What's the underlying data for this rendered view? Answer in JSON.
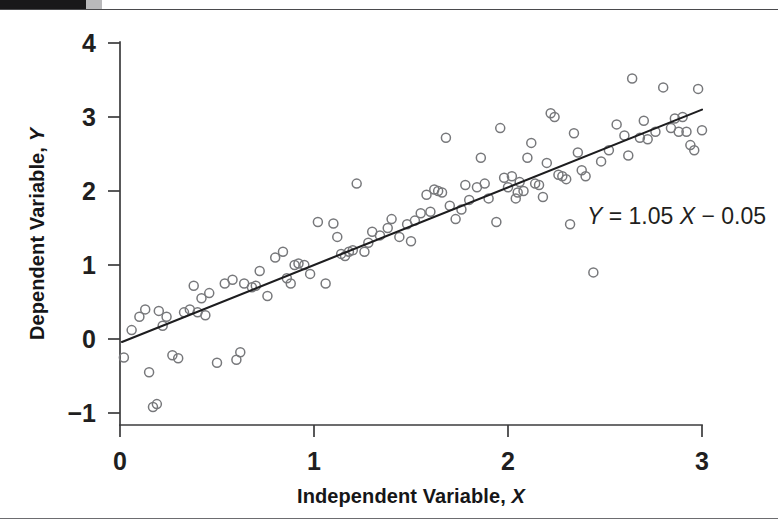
{
  "figure": {
    "background_color": "#ffffff",
    "top_bar_color": "#19181a",
    "top_bar_accent_color": "#b9b9bb",
    "rule_color": "#4a4a4d"
  },
  "chart_data": {
    "type": "scatter",
    "title": "",
    "xlabel": "Independent Variable, X",
    "ylabel": "Dependent Variable, Y",
    "xlabel_text": "Independent Variable, ",
    "xlabel_symbol": "X",
    "ylabel_text": "Dependent Variable, ",
    "ylabel_symbol": "Y",
    "xlim": [
      -0.08,
      3.12
    ],
    "ylim": [
      -1.25,
      4.15
    ],
    "xticks": [
      0,
      1,
      2,
      3
    ],
    "xtick_labels": [
      "0",
      "1",
      "2",
      "3"
    ],
    "yticks": [
      -1,
      0,
      1,
      2,
      3,
      4
    ],
    "ytick_labels": [
      "−1",
      "0",
      "1",
      "2",
      "3",
      "4"
    ],
    "grid": false,
    "legend": null,
    "marker_style": "open-circle",
    "marker_color": "#77787b",
    "marker_size": 9,
    "annotations": [
      {
        "name": "regression-equation",
        "text": "Y = 1.05 X − 0.05",
        "parts": [
          "Y",
          " = 1.05 ",
          "X",
          " − 0.05"
        ],
        "x": 2.42,
        "y": 1.72
      }
    ],
    "fit_line": {
      "name": "least-squares-line",
      "slope": 1.05,
      "intercept": -0.05,
      "color": "#1d1d1f",
      "x_start": 0.01,
      "x_end": 3.0,
      "y_start": -0.04,
      "y_end": 3.1
    },
    "x": [
      0.02,
      0.06,
      0.1,
      0.13,
      0.15,
      0.17,
      0.19,
      0.2,
      0.22,
      0.24,
      0.3,
      0.33,
      0.36,
      0.38,
      0.4,
      0.42,
      0.46,
      0.5,
      0.54,
      0.58,
      0.62,
      0.64,
      0.68,
      0.7,
      0.72,
      0.76,
      0.8,
      0.84,
      0.86,
      0.88,
      0.9,
      0.92,
      0.95,
      0.98,
      1.02,
      1.06,
      1.1,
      1.14,
      1.16,
      1.18,
      1.2,
      1.22,
      1.26,
      1.3,
      1.34,
      1.38,
      1.4,
      1.44,
      1.48,
      1.52,
      1.55,
      1.58,
      1.6,
      1.62,
      1.64,
      1.66,
      1.68,
      1.7,
      1.73,
      1.76,
      1.8,
      1.84,
      1.86,
      1.88,
      1.9,
      1.94,
      1.96,
      1.98,
      2.0,
      2.02,
      2.04,
      2.06,
      2.08,
      2.1,
      2.12,
      2.14,
      2.16,
      2.18,
      2.2,
      2.22,
      2.24,
      2.26,
      2.28,
      2.3,
      2.32,
      2.34,
      2.36,
      2.4,
      2.44,
      2.48,
      2.52,
      2.56,
      2.6,
      2.64,
      2.68,
      2.7,
      2.72,
      2.76,
      2.8,
      2.84,
      2.86,
      2.88,
      2.9,
      2.92,
      2.94,
      2.96,
      2.98,
      3.0,
      0.27,
      0.44,
      0.6,
      1.12,
      1.28,
      1.5,
      1.78,
      2.05,
      2.38,
      2.62
    ],
    "y": [
      -0.25,
      0.12,
      0.3,
      0.4,
      -0.45,
      -0.92,
      -0.88,
      0.38,
      0.18,
      0.3,
      -0.26,
      0.36,
      0.4,
      0.72,
      0.36,
      0.55,
      0.62,
      -0.32,
      0.75,
      0.8,
      -0.18,
      0.75,
      0.7,
      0.72,
      0.92,
      0.58,
      1.1,
      1.18,
      0.82,
      0.75,
      1.0,
      1.02,
      1.0,
      0.88,
      1.58,
      0.75,
      1.56,
      1.15,
      1.12,
      1.18,
      1.2,
      2.1,
      1.18,
      1.45,
      1.4,
      1.5,
      1.62,
      1.38,
      1.55,
      1.6,
      1.7,
      1.95,
      1.72,
      2.02,
      2.0,
      1.98,
      2.72,
      1.8,
      1.62,
      1.75,
      1.88,
      2.05,
      2.45,
      2.1,
      1.9,
      1.58,
      2.85,
      2.18,
      2.05,
      2.2,
      1.9,
      2.12,
      2.0,
      2.45,
      2.65,
      2.1,
      2.08,
      1.92,
      2.38,
      3.05,
      3.0,
      2.22,
      2.2,
      2.16,
      1.55,
      2.78,
      2.52,
      2.2,
      0.9,
      2.4,
      2.55,
      2.9,
      2.75,
      3.52,
      2.72,
      2.95,
      2.7,
      2.8,
      3.4,
      2.85,
      2.98,
      2.8,
      3.0,
      2.8,
      2.62,
      2.55,
      3.38,
      2.82,
      -0.22,
      0.32,
      -0.28,
      1.38,
      1.3,
      1.32,
      2.08,
      1.98,
      2.28,
      2.48
    ]
  }
}
